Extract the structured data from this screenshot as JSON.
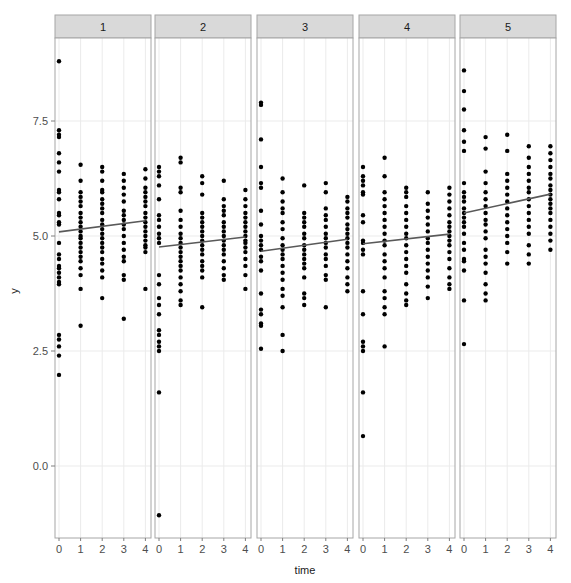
{
  "chart_data": {
    "type": "scatter",
    "title": "",
    "xlabel": "time",
    "ylabel": "y",
    "facet_labels": [
      "1",
      "2",
      "3",
      "4",
      "5"
    ],
    "x_ticks": [
      "0",
      "1",
      "2",
      "3",
      "4"
    ],
    "y_ticks": [
      "0.0",
      "2.5",
      "5.0",
      "7.5"
    ],
    "y_tick_values": [
      0,
      2.5,
      5.0,
      7.5
    ],
    "xlim": [
      -0.2,
      4.2
    ],
    "ylim": [
      -1.57,
      9.3
    ],
    "grid": true,
    "legend": "none",
    "colors": {
      "point": "#000000",
      "line": "#595959",
      "strip_fill": "#d9d9d9",
      "strip_border": "#a6a6a6",
      "panel_border": "#a6a6a6",
      "grid": "#ebebeb"
    },
    "panels": [
      {
        "facet": "1",
        "fit_line": {
          "x": [
            0,
            4
          ],
          "y": [
            5.09,
            5.33
          ]
        },
        "points": {
          "0": [
            8.8,
            7.3,
            7.2,
            7.15,
            6.8,
            6.6,
            6.4,
            6.0,
            5.95,
            5.8,
            5.5,
            5.45,
            5.3,
            5.25,
            4.85,
            4.6,
            4.5,
            4.35,
            4.3,
            4.2,
            4.1,
            4.0,
            3.95,
            2.85,
            2.75,
            2.6,
            2.4,
            1.98
          ],
          "1": [
            6.55,
            6.2,
            5.95,
            5.85,
            5.75,
            5.65,
            5.5,
            5.4,
            5.3,
            5.2,
            5.1,
            5.0,
            4.95,
            4.85,
            4.75,
            4.65,
            4.55,
            4.45,
            4.3,
            4.15,
            3.85,
            3.05
          ],
          "2": [
            6.5,
            6.4,
            6.2,
            6.0,
            5.95,
            5.8,
            5.7,
            5.6,
            5.5,
            5.35,
            5.25,
            5.15,
            5.05,
            4.95,
            4.85,
            4.75,
            4.65,
            4.5,
            4.4,
            4.25,
            4.1,
            3.65
          ],
          "3": [
            6.35,
            6.2,
            6.05,
            5.9,
            5.75,
            5.55,
            5.45,
            5.35,
            5.25,
            5.15,
            5.0,
            4.85,
            4.7,
            4.55,
            4.45,
            4.15,
            4.05,
            3.2
          ],
          "4": [
            6.45,
            6.25,
            6.05,
            5.95,
            5.85,
            5.75,
            5.65,
            5.5,
            5.4,
            5.3,
            5.2,
            5.1,
            5.0,
            4.9,
            4.8,
            4.75,
            4.65,
            3.85
          ]
        }
      },
      {
        "facet": "2",
        "fit_line": {
          "x": [
            0,
            4
          ],
          "y": [
            4.76,
            4.98
          ]
        },
        "points": {
          "0": [
            6.5,
            6.4,
            6.3,
            6.1,
            5.8,
            5.45,
            5.35,
            5.2,
            5.05,
            4.95,
            4.85,
            4.15,
            3.95,
            3.65,
            3.5,
            3.3,
            2.95,
            2.85,
            2.7,
            2.6,
            2.5,
            1.6,
            -1.07
          ],
          "1": [
            6.7,
            6.6,
            6.05,
            5.95,
            5.55,
            5.35,
            5.2,
            5.05,
            4.95,
            4.85,
            4.75,
            4.65,
            4.55,
            4.45,
            4.35,
            4.25,
            4.1,
            3.95,
            3.8,
            3.6,
            3.5
          ],
          "2": [
            6.3,
            6.15,
            5.9,
            5.5,
            5.4,
            5.3,
            5.2,
            5.1,
            5.0,
            4.9,
            4.8,
            4.7,
            4.6,
            4.45,
            4.35,
            4.25,
            4.1,
            3.45
          ],
          "3": [
            6.2,
            5.8,
            5.65,
            5.55,
            5.45,
            5.3,
            5.2,
            5.1,
            5.0,
            4.9,
            4.8,
            4.7,
            4.6,
            4.45,
            4.3,
            4.15,
            4.05
          ],
          "4": [
            6.0,
            5.8,
            5.65,
            5.5,
            5.4,
            5.3,
            5.2,
            5.1,
            5.0,
            4.9,
            4.85,
            4.75,
            4.65,
            4.5,
            4.35,
            4.15,
            3.85
          ]
        }
      },
      {
        "facet": "3",
        "fit_line": {
          "x": [
            0,
            4
          ],
          "y": [
            4.67,
            4.93
          ]
        },
        "points": {
          "0": [
            7.9,
            7.85,
            7.1,
            6.5,
            6.15,
            6.05,
            5.55,
            5.25,
            5.0,
            4.9,
            4.8,
            4.7,
            4.55,
            4.45,
            4.25,
            3.75,
            3.4,
            3.3,
            3.1,
            3.05,
            2.55
          ],
          "1": [
            6.25,
            5.95,
            5.75,
            5.6,
            5.5,
            5.3,
            5.15,
            4.95,
            4.8,
            4.7,
            4.6,
            4.5,
            4.35,
            4.2,
            4.05,
            3.85,
            3.7,
            3.45,
            2.85,
            2.5
          ],
          "2": [
            6.1,
            5.5,
            5.4,
            5.3,
            5.2,
            5.05,
            4.95,
            4.8,
            4.7,
            4.6,
            4.5,
            4.4,
            4.3,
            4.1,
            3.75,
            3.65,
            3.5
          ],
          "3": [
            6.15,
            5.95,
            5.6,
            5.45,
            5.35,
            5.2,
            5.05,
            4.95,
            4.85,
            4.75,
            4.6,
            4.5,
            4.35,
            4.15,
            4.05,
            3.45
          ],
          "4": [
            5.85,
            5.75,
            5.6,
            5.5,
            5.4,
            5.25,
            5.15,
            5.05,
            4.95,
            4.85,
            4.75,
            4.6,
            4.45,
            4.3,
            4.1,
            3.95,
            3.8
          ]
        }
      },
      {
        "facet": "4",
        "fit_line": {
          "x": [
            0,
            4
          ],
          "y": [
            4.83,
            5.04
          ]
        },
        "points": {
          "0": [
            6.5,
            6.3,
            6.2,
            6.1,
            5.95,
            5.9,
            5.45,
            5.3,
            4.9,
            4.85,
            4.7,
            4.6,
            3.8,
            3.3,
            2.7,
            2.6,
            2.5,
            1.6,
            0.65
          ],
          "1": [
            6.7,
            6.3,
            5.95,
            5.8,
            5.65,
            5.5,
            5.35,
            5.2,
            5.05,
            4.9,
            4.8,
            4.6,
            4.45,
            4.3,
            4.1,
            3.8,
            3.65,
            3.45,
            3.3,
            2.6
          ],
          "2": [
            6.05,
            5.95,
            5.85,
            5.65,
            5.5,
            5.35,
            5.2,
            5.05,
            4.95,
            4.8,
            4.65,
            4.5,
            4.35,
            4.2,
            3.95,
            3.75,
            3.6,
            3.5
          ],
          "3": [
            5.95,
            5.7,
            5.55,
            5.4,
            5.25,
            5.1,
            4.95,
            4.85,
            4.7,
            4.55,
            4.4,
            4.25,
            4.1,
            3.9,
            3.65
          ],
          "4": [
            6.05,
            5.9,
            5.75,
            5.6,
            5.45,
            5.3,
            5.2,
            5.1,
            5.0,
            4.9,
            4.8,
            4.65,
            4.5,
            4.3,
            4.1,
            3.95,
            3.85
          ]
        }
      },
      {
        "facet": "5",
        "fit_line": {
          "x": [
            0,
            4
          ],
          "y": [
            5.5,
            5.91
          ]
        },
        "points": {
          "0": [
            8.6,
            8.15,
            7.75,
            7.3,
            7.05,
            6.85,
            6.15,
            5.95,
            5.85,
            5.75,
            5.6,
            5.5,
            5.4,
            5.3,
            5.2,
            5.05,
            4.85,
            4.7,
            4.5,
            4.45,
            4.25,
            3.6,
            2.65
          ],
          "1": [
            7.15,
            6.9,
            6.4,
            6.15,
            5.95,
            5.8,
            5.65,
            5.5,
            5.35,
            5.25,
            5.1,
            4.95,
            4.7,
            4.55,
            4.4,
            4.2,
            3.95,
            3.75,
            3.6
          ],
          "2": [
            7.2,
            6.85,
            6.35,
            6.2,
            6.05,
            5.9,
            5.75,
            5.6,
            5.45,
            5.3,
            5.15,
            5.0,
            4.85,
            4.65,
            4.4
          ],
          "3": [
            6.95,
            6.7,
            6.5,
            6.35,
            6.2,
            6.05,
            5.95,
            5.8,
            5.65,
            5.5,
            5.35,
            5.2,
            5.05,
            4.8,
            4.6,
            4.4
          ],
          "4": [
            6.95,
            6.8,
            6.65,
            6.5,
            6.35,
            6.25,
            6.1,
            6.0,
            5.9,
            5.8,
            5.7,
            5.6,
            5.5,
            5.35,
            5.2,
            5.05,
            4.9,
            4.7
          ]
        }
      }
    ]
  }
}
